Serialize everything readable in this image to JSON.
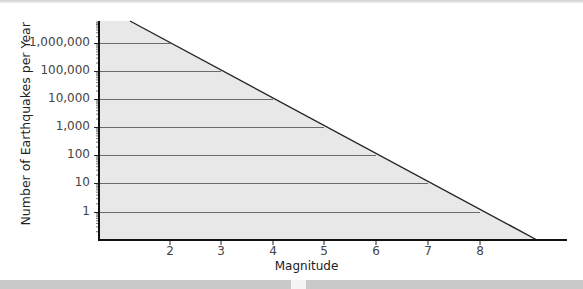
{
  "chart_data": {
    "type": "area",
    "title": "",
    "xlabel": "Magnitude",
    "ylabel": "Number of Earthquakes per Year",
    "yscale": "log",
    "x_ticks": [
      2,
      3,
      4,
      5,
      6,
      7,
      8
    ],
    "y_ticks": [
      1,
      10,
      100,
      1000,
      10000,
      100000,
      1000000
    ],
    "y_tick_labels": [
      "1",
      "10",
      "100",
      "1,000",
      "10,000",
      "100,000",
      "1,000,000"
    ],
    "x": [
      2,
      3,
      4,
      5,
      6,
      7,
      8
    ],
    "values": [
      1000000,
      100000,
      10000,
      1000,
      100,
      10,
      1
    ],
    "series": [
      {
        "name": "Earthquakes per year",
        "x": [
          2,
          3,
          4,
          5,
          6,
          7,
          8
        ],
        "values": [
          1000000,
          100000,
          10000,
          1000,
          100,
          10,
          1
        ]
      }
    ],
    "xlim": [
      0.6,
      9.8
    ],
    "ylim": [
      0.1,
      10000000
    ],
    "grid": "horizontal",
    "legend": "none",
    "fill_color": "#e6e6e6",
    "line_color": "#222222"
  },
  "labels": {
    "x_title": "Magnitude",
    "y_title": "Number of Earthquakes per Year",
    "y_ticks": [
      "1,000,000",
      "100,000",
      "10,000",
      "1,000",
      "100",
      "10",
      "1"
    ],
    "x_ticks": [
      "2",
      "3",
      "4",
      "5",
      "6",
      "7",
      "8"
    ]
  }
}
